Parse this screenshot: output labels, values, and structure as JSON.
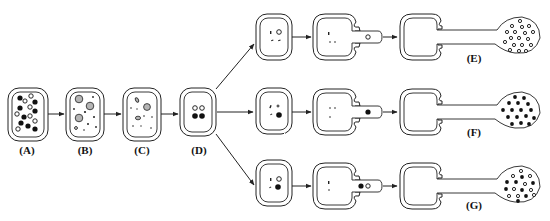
{
  "diagram": {
    "type": "cell-developmental-sequence",
    "stages": [
      {
        "id": "A",
        "label": "(A)",
        "x": 27,
        "description": "cell with many black and white granules"
      },
      {
        "id": "B",
        "label": "(B)",
        "x": 85,
        "description": "cell with grey vacuoles and small specks"
      },
      {
        "id": "C",
        "label": "(C)",
        "x": 142,
        "description": "cell with fewer grey inclusions and specks"
      },
      {
        "id": "D",
        "label": "(D)",
        "x": 199,
        "description": "cell with two white and two black granules"
      }
    ],
    "branches": [
      {
        "id": "E",
        "label": "(E)",
        "outcome": "sporangium with white (open) spores only",
        "spore_fill": "white"
      },
      {
        "id": "F",
        "label": "(F)",
        "outcome": "sporangium with black (filled) spores only",
        "spore_fill": "black"
      },
      {
        "id": "G",
        "label": "(G)",
        "outcome": "sporangium with mixed black and white spores",
        "spore_fill": "mixed"
      }
    ],
    "colors": {
      "stroke": "#222222",
      "background": "#ffffff",
      "vacuole_grey": "#b5b5b5",
      "granule_black": "#111111"
    }
  }
}
